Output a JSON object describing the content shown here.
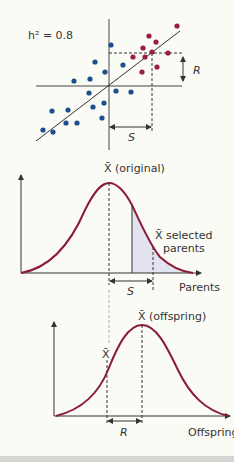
{
  "colors": {
    "background": "#fbfbf5",
    "axis": "#333333",
    "curve": "#8a1a38",
    "blue_points": "#1d4f8c",
    "red_points": "#9b1d3e",
    "shading": "#e2e3ef",
    "bottom_bar": "#d4d4d0"
  },
  "scatter": {
    "heritability_label": "h² = 0.8",
    "r_label": "R",
    "s_label": "S",
    "blue_points": [
      [
        111,
        45
      ],
      [
        95,
        62
      ],
      [
        123,
        65
      ],
      [
        105,
        72
      ],
      [
        74,
        81
      ],
      [
        90,
        79
      ],
      [
        89,
        93
      ],
      [
        116,
        91
      ],
      [
        131,
        92
      ],
      [
        52,
        111
      ],
      [
        68,
        110
      ],
      [
        93,
        107
      ],
      [
        104,
        103
      ],
      [
        66,
        123
      ],
      [
        77,
        123
      ],
      [
        102,
        118
      ],
      [
        43,
        130
      ],
      [
        53,
        132
      ]
    ],
    "red_points": [
      [
        177,
        26
      ],
      [
        149,
        36
      ],
      [
        156,
        42
      ],
      [
        143,
        48
      ],
      [
        133,
        57
      ],
      [
        145,
        57
      ],
      [
        152,
        52
      ],
      [
        168,
        53
      ],
      [
        142,
        72
      ],
      [
        157,
        67
      ]
    ]
  },
  "parents_chart": {
    "mean_label": "X̄ (original)",
    "selected_label_line1": "X̄ selected",
    "selected_label_line2": "parents",
    "s_label": "S",
    "axis_label": "Parents"
  },
  "offspring_chart": {
    "mean_label": "X̄ (offspring)",
    "orig_mean_label": "X̄",
    "r_label": "R",
    "axis_label": "Offspring"
  }
}
